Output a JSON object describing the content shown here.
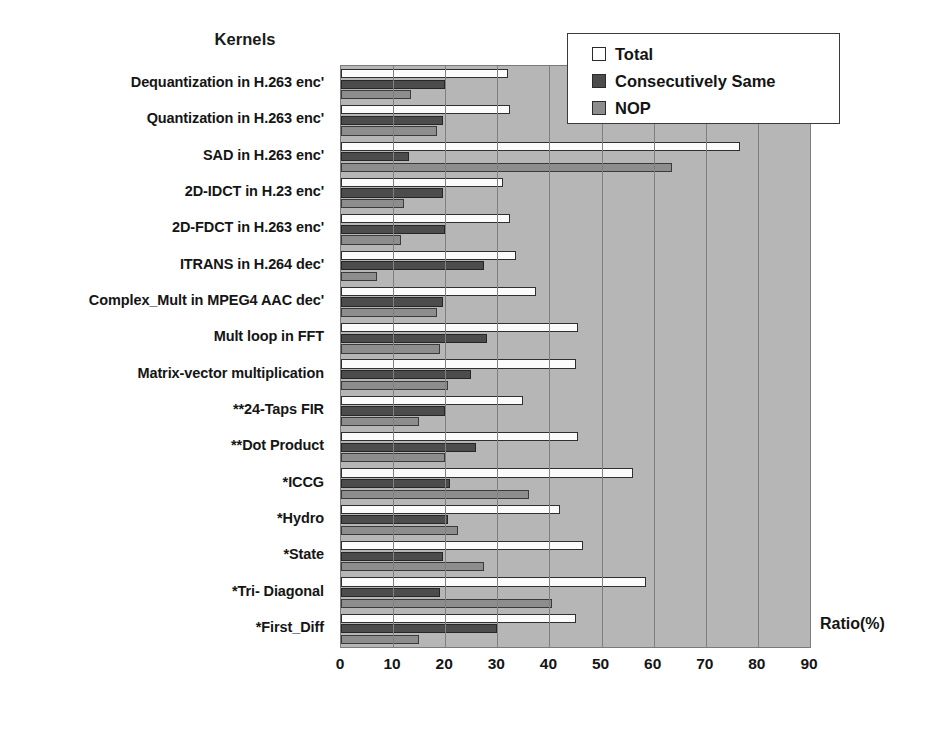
{
  "chart_data": {
    "type": "bar",
    "orientation": "horizontal",
    "title": "",
    "xlabel": "Ratio(%)",
    "ylabel": "Kernels",
    "xlim": [
      0,
      90
    ],
    "xticks": [
      0,
      10,
      20,
      30,
      40,
      50,
      60,
      70,
      80,
      90
    ],
    "grid": true,
    "legend_position": "top-right",
    "categories": [
      "Dequantization in H.263 enc'",
      "Quantization in H.263 enc'",
      "SAD in H.263 enc'",
      "2D-IDCT in H.23 enc'",
      "2D-FDCT in H.263 enc'",
      "ITRANS  in H.264 dec'",
      "Complex_Mult  in MPEG4 AAC dec'",
      "Mult loop in FFT",
      "Matrix-vector multiplication",
      "**24-Taps FIR",
      "**Dot Product",
      "*ICCG",
      "*Hydro",
      "*State",
      "*Tri- Diagonal",
      "*First_Diff"
    ],
    "series": [
      {
        "name": "Total",
        "color": "#fbfbfb",
        "values": [
          32.0,
          32.5,
          76.5,
          31.0,
          32.5,
          33.5,
          37.5,
          45.5,
          45.0,
          35.0,
          45.5,
          56.0,
          42.0,
          46.5,
          58.5,
          45.0
        ]
      },
      {
        "name": "Consecutively Same",
        "color": "#4c4c4c",
        "values": [
          20.0,
          19.5,
          13.0,
          19.5,
          20.0,
          27.5,
          19.5,
          28.0,
          25.0,
          20.0,
          26.0,
          21.0,
          20.5,
          19.5,
          19.0,
          30.0
        ]
      },
      {
        "name": "NOP",
        "color": "#8d8d8d",
        "values": [
          13.5,
          18.5,
          63.5,
          12.0,
          11.5,
          7.0,
          18.5,
          19.0,
          20.5,
          15.0,
          20.0,
          36.0,
          22.5,
          27.5,
          40.5,
          15.0
        ]
      }
    ]
  },
  "axis_titles": {
    "kernels": "Kernels",
    "ratio": "Ratio(%)"
  },
  "legend": {
    "entries": [
      {
        "label": "Total",
        "swatch": "#ffffff"
      },
      {
        "label": "Consecutively Same",
        "swatch": "#4c4c4c"
      },
      {
        "label": "NOP",
        "swatch": "#8d8d8d"
      }
    ]
  }
}
